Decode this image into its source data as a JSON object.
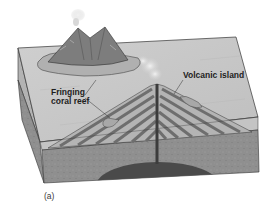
{
  "figure": {
    "labels": {
      "volcanic_island": "Volcanic island",
      "fringing_reef_line1": "Fringing",
      "fringing_reef_line2": "coral reef"
    },
    "caption": "(a)"
  },
  "colors": {
    "sea_surface": "#c8c8c8",
    "sea_side": "#bdbdbd",
    "crust": "#8f8f8f",
    "crust_side": "#7c7c7c",
    "magma_chamber": "#4a4a4a",
    "volcano_stripe_dark": "#6e6e6e",
    "volcano_stripe_light": "#b4b4b4",
    "outline": "#333333",
    "island": "#7d7d7d",
    "smoke": "#d6d6d6"
  }
}
